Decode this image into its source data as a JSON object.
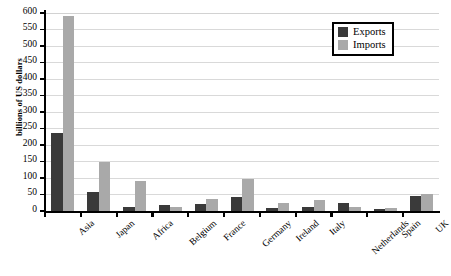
{
  "chart_data": {
    "type": "bar",
    "title": "",
    "xlabel": "",
    "ylabel": "billions of US dollars",
    "ylim": [
      0,
      600
    ],
    "ytick_step": 50,
    "yticks": [
      0,
      50,
      100,
      150,
      200,
      250,
      300,
      350,
      400,
      450,
      500,
      550,
      600
    ],
    "grid": true,
    "legend_position": "top-right",
    "categories": [
      "Asia",
      "Japan",
      "Africa",
      "Belgium",
      "France",
      "Germany",
      "Ireland",
      "Italy",
      "Netherlands",
      "Spain",
      "UK"
    ],
    "series": [
      {
        "name": "Exports",
        "color": "#3a3a3a",
        "values": [
          236,
          58,
          13,
          17,
          22,
          42,
          8,
          13,
          25,
          7,
          45
        ]
      },
      {
        "name": "Imports",
        "color": "#a9a9a9",
        "values": [
          590,
          148,
          90,
          12,
          35,
          97,
          25,
          32,
          13,
          9,
          52
        ]
      }
    ]
  },
  "legend": {
    "items": [
      {
        "label": "Exports",
        "swatch": "exports"
      },
      {
        "label": "Imports",
        "swatch": "imports"
      }
    ]
  }
}
